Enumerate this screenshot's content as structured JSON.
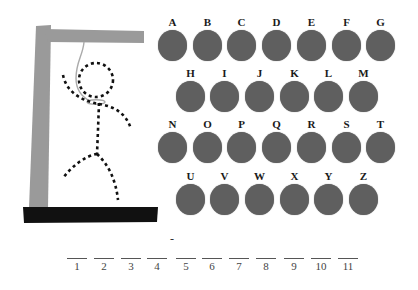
{
  "game": {
    "type": "hangman",
    "colors": {
      "post": "#9a9a9a",
      "base": "#111111",
      "figure": "#111111",
      "rope": "#aaaaaa",
      "letter_disc": "#5f5f5f"
    },
    "figure_parts_drawn": [
      "head",
      "body",
      "left-arm",
      "right-arm",
      "left-leg",
      "right-leg",
      "noose"
    ]
  },
  "keyboard": {
    "rows": [
      [
        "A",
        "B",
        "C",
        "D",
        "E",
        "F",
        "G"
      ],
      [
        "H",
        "I",
        "J",
        "K",
        "L",
        "M"
      ],
      [
        "N",
        "O",
        "P",
        "Q",
        "R",
        "S",
        "T"
      ],
      [
        "U",
        "V",
        "W",
        "X",
        "Y",
        "Z"
      ]
    ]
  },
  "word": {
    "slots": [
      {
        "num": "1",
        "char": ""
      },
      {
        "num": "2",
        "char": ""
      },
      {
        "num": "3",
        "char": ""
      },
      {
        "num": "4",
        "char": ""
      },
      {
        "num": "5",
        "char": ""
      },
      {
        "num": "6",
        "char": ""
      },
      {
        "num": "7",
        "char": ""
      },
      {
        "num": "8",
        "char": ""
      },
      {
        "num": "9",
        "char": ""
      },
      {
        "num": "10",
        "char": ""
      },
      {
        "num": "11",
        "char": ""
      }
    ],
    "separator_between_4_and_5": "-"
  }
}
